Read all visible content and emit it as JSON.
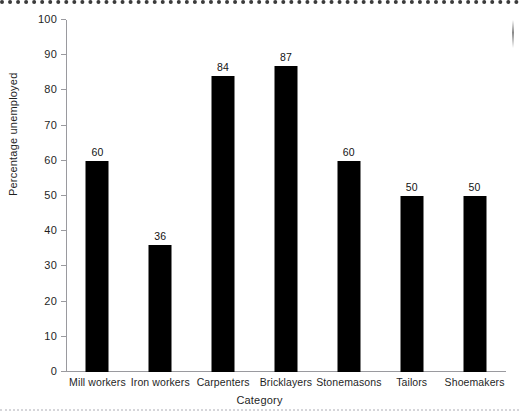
{
  "chart_data": {
    "type": "bar",
    "title": "",
    "xlabel": "Category",
    "ylabel": "Percentage unemployed",
    "categories": [
      "Mill workers",
      "Iron workers",
      "Carpenters",
      "Bricklayers",
      "Stonemasons",
      "Tailors",
      "Shoemakers"
    ],
    "values": [
      60,
      36,
      84,
      87,
      60,
      50,
      50
    ],
    "value_labels": [
      "60",
      "36",
      "84",
      "87",
      "60",
      "50",
      "50"
    ],
    "ylim": [
      0,
      100
    ],
    "ytick_values": [
      0,
      10,
      20,
      30,
      40,
      50,
      60,
      70,
      80,
      90,
      100
    ],
    "ytick_labels": [
      "0",
      "10",
      "20",
      "30",
      "40",
      "50",
      "60",
      "70",
      "80",
      "90",
      "100"
    ],
    "grid": false,
    "legend": false,
    "legend_position": "none",
    "bar_color": "#000000",
    "axis_color": "#9a9a9f",
    "background_color": "#ffffff"
  }
}
